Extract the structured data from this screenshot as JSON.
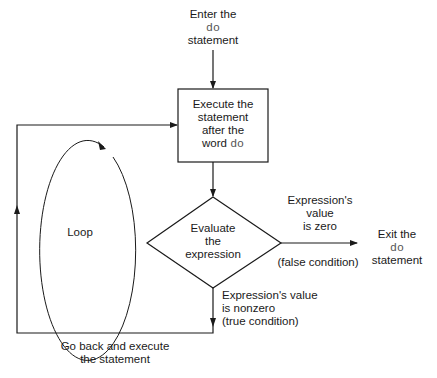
{
  "diagram": {
    "type": "flowchart",
    "nodes": {
      "enter": {
        "line1": "Enter the",
        "keyword": "do",
        "line3": "statement"
      },
      "execute": {
        "line1": "Execute the",
        "line2": "statement",
        "line3": "after the",
        "line4_prefix": "word",
        "keyword": "do"
      },
      "evaluate": {
        "line1": "Evaluate",
        "line2": "the",
        "line3": "expression"
      },
      "exit": {
        "line1": "Exit the",
        "keyword": "do",
        "line3": "statement"
      },
      "loop": {
        "label": "Loop"
      }
    },
    "edges": {
      "false_branch": {
        "line1": "Expression's",
        "line2": "value",
        "line3": "is zero",
        "condition": "(false condition)"
      },
      "true_branch": {
        "line1": "Expression's value",
        "line2": "is nonzero",
        "line3": "(true condition)"
      },
      "go_back": {
        "line1": "Go back and execute",
        "line2": "the statement"
      }
    },
    "colors": {
      "stroke": "#1a1a1a",
      "text": "#1a1a1a",
      "keyword": "#555555"
    }
  }
}
